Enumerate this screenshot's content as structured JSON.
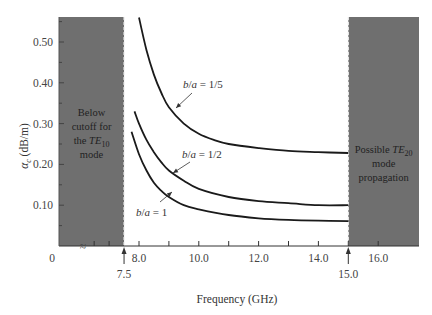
{
  "chart_data": {
    "type": "line",
    "title": "",
    "xlabel": "Frequency (GHz)",
    "ylabel": "α_c (dB/m)",
    "ylabel_main": "α",
    "ylabel_sub": "c",
    "ylabel_unit": " (dB/m)",
    "xlim": [
      7.0,
      17.0
    ],
    "ylim": [
      0,
      0.56
    ],
    "grid": false,
    "x_ticks": [
      {
        "value": 0,
        "label": "0"
      },
      {
        "value": 8.0,
        "label": "8.0"
      },
      {
        "value": 10.0,
        "label": "10.0"
      },
      {
        "value": 12.0,
        "label": "12.0"
      },
      {
        "value": 14.0,
        "label": "14.0"
      },
      {
        "value": 16.0,
        "label": "16.0"
      }
    ],
    "x_markers": [
      {
        "value": 7.5,
        "label": "7.5"
      },
      {
        "value": 15.0,
        "label": "15.0"
      }
    ],
    "y_ticks": [
      {
        "value": 0.1,
        "label": "0.10"
      },
      {
        "value": 0.2,
        "label": "0.20"
      },
      {
        "value": 0.3,
        "label": "0.30"
      },
      {
        "value": 0.4,
        "label": "0.40"
      },
      {
        "value": 0.5,
        "label": "0.50"
      }
    ],
    "axis_break_symbol": "≈",
    "regions": [
      {
        "name": "below-cutoff",
        "from": "axis-start",
        "to": 7.5,
        "lines": [
          "Below",
          "cutoff for",
          "the TE",
          "mode"
        ],
        "subscript": "10"
      },
      {
        "name": "te20-propagation",
        "from": 15.0,
        "to": 17.4,
        "lines": [
          "Possible TE",
          "mode",
          "propagation"
        ],
        "subscript": "20"
      }
    ],
    "series": [
      {
        "name": "b/a = 1/5",
        "x": [
          8.0,
          8.25,
          8.5,
          8.75,
          9.0,
          9.5,
          10.0,
          10.5,
          11.0,
          12.0,
          13.0,
          14.0,
          15.0
        ],
        "values": [
          0.56,
          0.48,
          0.42,
          0.375,
          0.34,
          0.3,
          0.275,
          0.26,
          0.25,
          0.24,
          0.233,
          0.23,
          0.228
        ]
      },
      {
        "name": "b/a = 1/2",
        "x": [
          7.85,
          8.0,
          8.25,
          8.5,
          8.75,
          9.0,
          9.5,
          10.0,
          11.0,
          12.0,
          13.0,
          14.0,
          15.0
        ],
        "values": [
          0.33,
          0.3,
          0.26,
          0.23,
          0.205,
          0.185,
          0.16,
          0.14,
          0.12,
          0.11,
          0.105,
          0.1,
          0.1
        ]
      },
      {
        "name": "b/a = 1",
        "x": [
          7.75,
          8.0,
          8.25,
          8.5,
          8.75,
          9.0,
          9.5,
          10.0,
          11.0,
          12.0,
          13.0,
          14.0,
          15.0
        ],
        "values": [
          0.28,
          0.225,
          0.185,
          0.155,
          0.135,
          0.12,
          0.1,
          0.09,
          0.076,
          0.068,
          0.064,
          0.062,
          0.061
        ]
      }
    ],
    "annotations": [
      {
        "text_pre": "b",
        "text_mid": "/",
        "text_var": "a",
        "text_post": " = 1/5",
        "points_to": "b/a = 1/5"
      },
      {
        "text_pre": "b",
        "text_mid": "/",
        "text_var": "a",
        "text_post": " = 1/2",
        "points_to": "b/a = 1/2"
      },
      {
        "text_pre": "b",
        "text_mid": "/",
        "text_var": "a",
        "text_post": " = 1",
        "points_to": "b/a = 1"
      }
    ]
  }
}
